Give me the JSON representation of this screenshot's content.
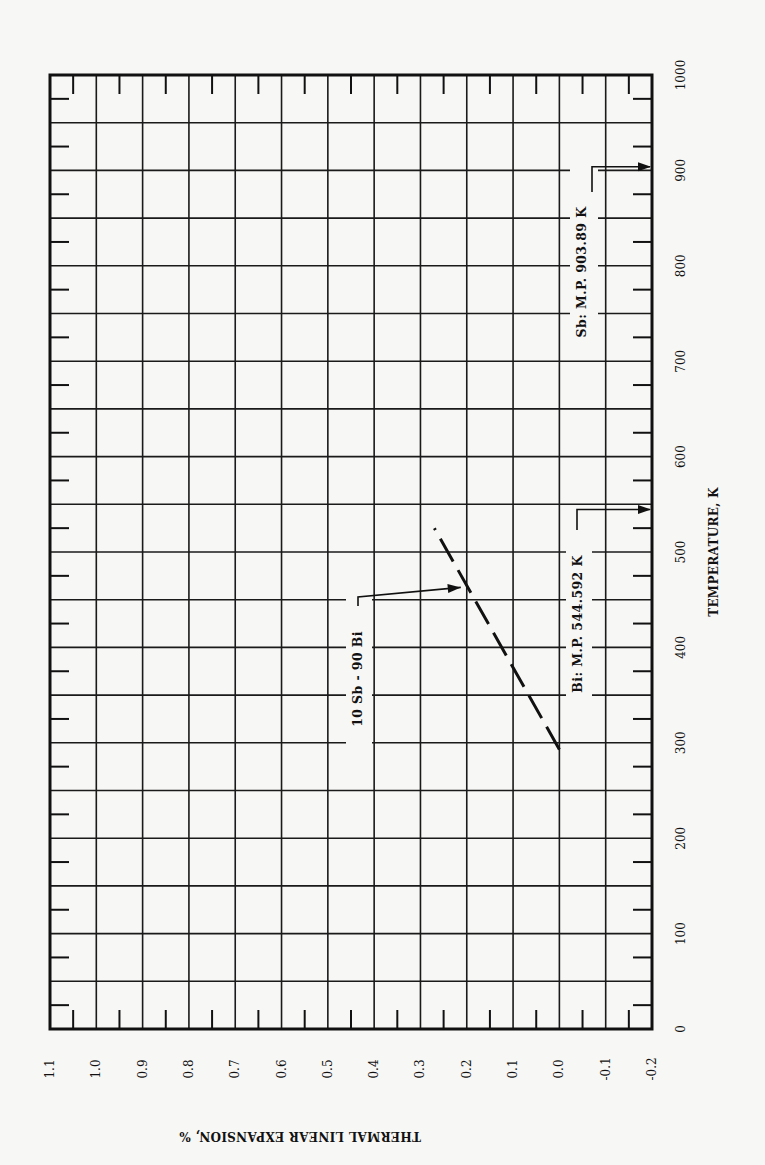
{
  "chart_data": {
    "type": "line",
    "orientation": "rotated-90",
    "title": "",
    "xlabel": "TEMPERATURE, K",
    "ylabel": "THERMAL LINEAR EXPANSION, %",
    "xlim": [
      0,
      1000
    ],
    "ylim": [
      -0.2,
      1.1
    ],
    "x_ticks": [
      0,
      100,
      200,
      300,
      400,
      500,
      600,
      700,
      800,
      900,
      1000
    ],
    "x_tick_labels": [
      "0",
      "100",
      "200",
      "300",
      "400",
      "500",
      "600",
      "700",
      "800",
      "900",
      "1000"
    ],
    "y_ticks": [
      1.1,
      1.0,
      0.9,
      0.8,
      0.7,
      0.6,
      0.5,
      0.4,
      0.3,
      0.2,
      0.1,
      0.0,
      -0.1,
      -0.2
    ],
    "y_tick_labels": [
      "1.1",
      "1.0",
      "0.9",
      "0.8",
      "0.7",
      "0.6",
      "0.5",
      "0.4",
      "0.3",
      "0.2",
      "0.1",
      "0.0",
      "-0.1",
      "-0.2"
    ],
    "grid": true,
    "grid_minor_x_step": 50,
    "series": [
      {
        "name": "10 Sb - 90 Bi",
        "style": "dashed",
        "x": [
          293,
          525
        ],
        "values": [
          0.0,
          0.27
        ]
      }
    ],
    "annotations": [
      {
        "text": "10 Sb - 90 Bi",
        "points_to": {
          "x": 465,
          "y": 0.2
        }
      },
      {
        "text": "Bi: M.P. 544.592 K",
        "points_to": {
          "x": 544.592,
          "y": -0.2
        }
      },
      {
        "text": "Sb: M.P. 903.89 K",
        "points_to": {
          "x": 903.89,
          "y": -0.2
        }
      }
    ],
    "legend": "none"
  },
  "labels": {
    "xlabel": "TEMPERATURE, K",
    "ylabel": "THERMAL LINEAR EXPANSION, %",
    "series_label": "10 Sb - 90 Bi",
    "bi_mp": "Bi:  M.P.  544.592 K",
    "sb_mp": "Sb:  M.P.  903.89 K"
  }
}
